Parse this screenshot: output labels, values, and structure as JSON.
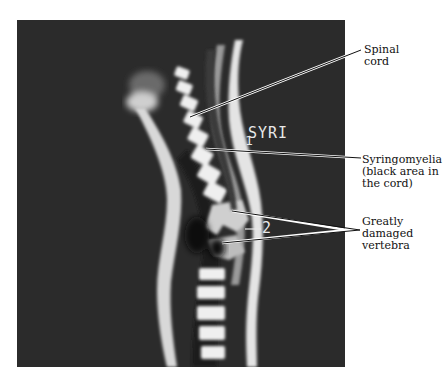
{
  "figure": {
    "type": "MRI sagittal spine image with annotations",
    "photo": {
      "overlay_label": "SYRI",
      "marker_1": "1",
      "marker_2": "2"
    },
    "annotations": [
      {
        "id": "spinal-cord",
        "text": "Spinal\ncord"
      },
      {
        "id": "syringomyelia",
        "text": "Syringomyelia\n(black area in\nthe cord)"
      },
      {
        "id": "damaged-vertebra",
        "text": "Greatly\ndamaged\nvertebra"
      }
    ],
    "colors": {
      "background": "#ffffff",
      "photo_bg": "#2b2b2b",
      "bone_highlight": "#f2f2f2",
      "leader_line": "#111111"
    }
  }
}
